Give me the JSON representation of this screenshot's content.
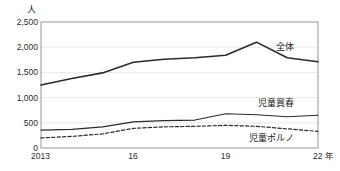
{
  "chart_data": {
    "type": "line",
    "title": "",
    "xlabel": "年",
    "ylabel": "人",
    "unit_label": "人",
    "x_unit_suffix": "年",
    "x": [
      2013,
      2014,
      2015,
      2016,
      2017,
      2018,
      2019,
      2020,
      2021,
      2022
    ],
    "xtick_labels": [
      "2013",
      "16",
      "19",
      "22"
    ],
    "xtick_values": [
      2013,
      2016,
      2019,
      2022
    ],
    "ytick_labels": [
      "0",
      "500",
      "1,000",
      "1,500",
      "2,000",
      "2,500"
    ],
    "ytick_values": [
      0,
      500,
      1000,
      1500,
      2000,
      2500
    ],
    "ylim": [
      0,
      2500
    ],
    "xlim": [
      2013,
      2022
    ],
    "grid": true,
    "legend_position": "inline-right",
    "series": [
      {
        "name": "全体",
        "label": "全体",
        "style": "solid",
        "color": "#2b2b2b",
        "width": 1.6,
        "values": [
          1250,
          1380,
          1490,
          1700,
          1760,
          1790,
          1840,
          2100,
          1790,
          1710
        ],
        "label_x": 2021.1,
        "label_y": 1980
      },
      {
        "name": "児童買春",
        "label": "児童買春",
        "style": "solid",
        "color": "#2b2b2b",
        "width": 1.2,
        "values": [
          355,
          370,
          420,
          520,
          545,
          555,
          680,
          660,
          620,
          650
        ],
        "label_x": 2021.1,
        "label_y": 880
      },
      {
        "name": "児童ポルノ",
        "label": "児童ポルノ",
        "style": "dashed",
        "color": "#2b2b2b",
        "width": 1.2,
        "values": [
          200,
          230,
          280,
          390,
          420,
          430,
          450,
          430,
          380,
          330
        ],
        "label_x": 2021.1,
        "label_y": 170
      }
    ]
  }
}
